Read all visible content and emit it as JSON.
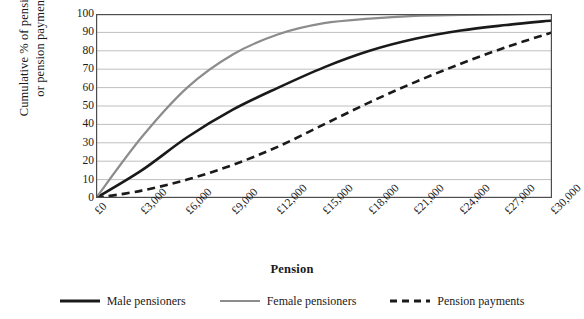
{
  "chart_data": {
    "type": "line",
    "title": "",
    "xlabel": "Pension",
    "ylabel": "Cumulative % of pensioners or pension payments",
    "ylabel_lines": [
      "Cumulative % of pensioners",
      "or pension payments"
    ],
    "xlim": [
      0,
      30000
    ],
    "ylim": [
      0,
      100
    ],
    "grid": true,
    "grid_axis": "y",
    "legend_position": "bottom",
    "x": [
      0,
      3000,
      6000,
      9000,
      12000,
      15000,
      18000,
      21000,
      24000,
      27000,
      30000
    ],
    "categories": [
      "£0",
      "£3,000",
      "£6,000",
      "£9,000",
      "£12,000",
      "£15,000",
      "£18,000",
      "£21,000",
      "£24,000",
      "£27,000",
      "£30,000"
    ],
    "yticks": [
      0,
      10,
      20,
      30,
      40,
      50,
      60,
      70,
      80,
      90,
      100
    ],
    "series": [
      {
        "name": "Male pensioners",
        "color": "#1a1a1a",
        "style": "solid",
        "width": 2.6,
        "values": [
          0,
          15,
          33,
          48,
          60,
          71,
          80,
          86.5,
          91,
          94,
          96.5
        ]
      },
      {
        "name": "Female pensioners",
        "color": "#8c8c8c",
        "style": "solid",
        "width": 2.2,
        "values": [
          0,
          33,
          60,
          78,
          89,
          95,
          97.5,
          99,
          99.5,
          99.8,
          100
        ]
      },
      {
        "name": "Pension payments",
        "color": "#1a1a1a",
        "style": "dashed",
        "width": 2.6,
        "values": [
          0,
          4,
          10,
          18,
          28,
          40,
          52,
          63,
          73,
          82,
          90
        ]
      }
    ]
  },
  "legend": {
    "items": [
      {
        "label": "Male pensioners"
      },
      {
        "label": "Female pensioners"
      },
      {
        "label": "Pension payments"
      }
    ]
  },
  "colors": {
    "axis": "#4d4d4d",
    "grid": "#bfbfbf",
    "male": "#1a1a1a",
    "female": "#8c8c8c",
    "payments": "#1a1a1a",
    "background": "#ffffff"
  }
}
